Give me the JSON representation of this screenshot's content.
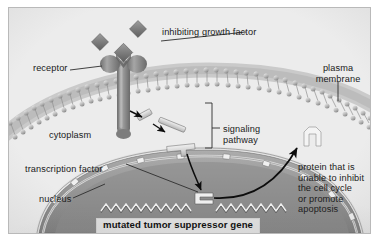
{
  "figure": {
    "type": "cell-biology-diagram",
    "palette": {
      "background": "#ffffff",
      "panel_fill": "#e9e9e9",
      "panel_border": "#b9b9b9",
      "membrane_gray": "#b0b0b0",
      "protein_gray": "#8f8f8f",
      "nucleus_gray": "#9a9a9a",
      "text": "#1a1a1a",
      "gene_box_fill": "#dcdcdc",
      "leader_line": "#3a3a3a",
      "arrow": "#111111",
      "white_protein": "#f2f2f2"
    }
  },
  "labels": {
    "growth_factor": "inhibiting growth factor",
    "receptor": "receptor",
    "plasma_membrane": "plasma\nmembrane",
    "plasma_membrane_line1": "plasma",
    "plasma_membrane_line2": "membrane",
    "cytoplasm": "cytoplasm",
    "signaling_pathway_line1": "signaling",
    "signaling_pathway_line2": "pathway",
    "transcription_factor": "transcription factor",
    "nucleus": "nucleus",
    "mutated_gene": "mutated tumor suppressor gene",
    "protein_outcome_line1": "protein that is",
    "protein_outcome_line2": "unable to inhibit",
    "protein_outcome_line3": "the cell cycle",
    "protein_outcome_line4": "or promote",
    "protein_outcome_line5": "apoptosis"
  },
  "structures": {
    "ligands": "three gray diamond growth factor molecules",
    "receptor_shape": "mushroom-shaped transmembrane receptor with notched binding head",
    "membrane_shape": "curved phospholipid bilayer with two rows of head beads and tails",
    "signal_molecules": "three small gray rod-shaped signaling proteins in a cascade",
    "nuclear_envelope": "double-layered curved nuclear envelope with nuclear pores",
    "dna": "zig-zag double-stranded DNA ribbon inside nucleus",
    "bound_factor": "transcription factor bracket bound at the mutated gene locus",
    "product_protein": "white angular defective protein outside the nucleus"
  },
  "arrows": {
    "cascade_1": "receptor to first signaling molecule",
    "cascade_2": "first to second signaling molecule",
    "cascade_3": "second to third signaling molecule",
    "to_nucleus": "signaling cascade down into nucleus",
    "to_protein": "curved arrow from mutated gene out to defective protein"
  }
}
